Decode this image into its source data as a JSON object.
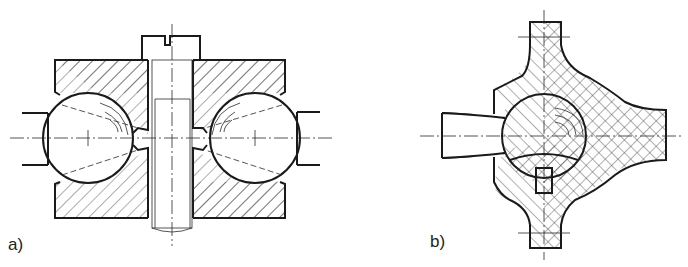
{
  "figure": {
    "subfigures": [
      {
        "id": "a",
        "label": "a)",
        "description": "Two ball joints clamped between hatched die blocks with central bolt"
      },
      {
        "id": "b",
        "label": "b)",
        "description": "Cross-shaped die section with central ball and side shank"
      }
    ]
  },
  "colors": {
    "line": "#1a1a1a",
    "background": "#ffffff"
  }
}
